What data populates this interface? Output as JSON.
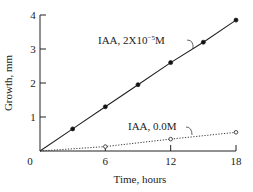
{
  "chart_data": {
    "type": "line",
    "title": "",
    "xlabel": "Time, hours",
    "ylabel": "Growth, mm",
    "xlim": [
      0,
      18
    ],
    "ylim": [
      0,
      4
    ],
    "x_ticks": [
      "0",
      "6",
      "12",
      "18"
    ],
    "y_ticks": [
      "1",
      "2",
      "3",
      "4"
    ],
    "origin_label": "0",
    "grid": false,
    "legend": "inline annotations",
    "series": [
      {
        "name": "IAA, 2X10⁻⁵M",
        "label_main": "IAA, 2X10",
        "label_exp": "−5",
        "label_unit": "M",
        "style": "solid, filled circles",
        "x": [
          0,
          3,
          6,
          9,
          12,
          15,
          18
        ],
        "y": [
          0,
          0.65,
          1.3,
          1.95,
          2.6,
          3.2,
          3.85
        ]
      },
      {
        "name": "IAA, 0.0M",
        "label": "IAA, 0.0M",
        "style": "dotted, open circles",
        "x": [
          0,
          6,
          12,
          18
        ],
        "y": [
          0,
          0.13,
          0.35,
          0.55
        ]
      }
    ]
  },
  "colors": {
    "line": "#222222",
    "background": "#ffffff"
  }
}
